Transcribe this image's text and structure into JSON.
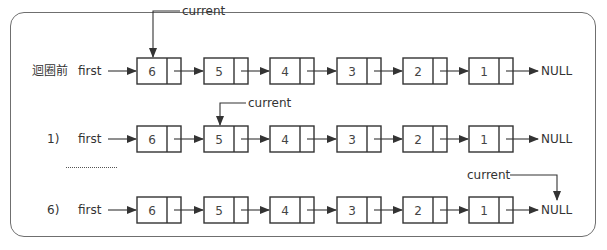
{
  "diagram": {
    "rows": [
      {
        "label": "迴圈前",
        "pointer_label": "first",
        "nodes": [
          "6",
          "5",
          "4",
          "3",
          "2",
          "1"
        ],
        "terminal": "NULL",
        "current_label": "current",
        "current_target": "node-6"
      },
      {
        "label": "1)",
        "pointer_label": "first",
        "nodes": [
          "6",
          "5",
          "4",
          "3",
          "2",
          "1"
        ],
        "terminal": "NULL",
        "current_label": "current",
        "current_target": "node-5"
      },
      {
        "label": "6)",
        "pointer_label": "first",
        "nodes": [
          "6",
          "5",
          "4",
          "3",
          "2",
          "1"
        ],
        "terminal": "NULL",
        "current_label": "current",
        "current_target": "NULL"
      }
    ],
    "ellipsis": "……………",
    "colors": {
      "stroke": "#333333",
      "frame": "#6f6f6f",
      "text": "#333333",
      "background": "#ffffff"
    }
  }
}
